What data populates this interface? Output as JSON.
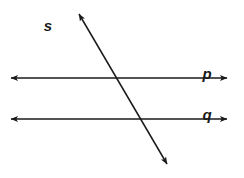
{
  "figure": {
    "kind": "geometry-diagram",
    "canvas": {
      "width": 244,
      "height": 178,
      "background": "#ffffff"
    },
    "stroke_color": "#1a1a1a",
    "stroke_width": 1.5
  },
  "labels": {
    "transversal": "s",
    "upper_parallel": "p",
    "lower_parallel": "q"
  },
  "lines": [
    {
      "id": "line-p",
      "label": "p",
      "orientation": "horizontal",
      "x1": 11,
      "y1": 78,
      "x2": 227,
      "y2": 78,
      "arrows": "both",
      "label_x": 207,
      "label_y": 72
    },
    {
      "id": "line-q",
      "label": "q",
      "orientation": "horizontal",
      "x1": 11,
      "y1": 119,
      "x2": 227,
      "y2": 119,
      "arrows": "both",
      "label_x": 207,
      "label_y": 113
    },
    {
      "id": "line-s",
      "label": "s",
      "orientation": "transversal",
      "x1": 79,
      "y1": 14,
      "x2": 167,
      "y2": 164,
      "arrows": "both",
      "label_x": 48,
      "label_y": 24
    }
  ],
  "intersections": [
    {
      "lines": "s-and-p",
      "x": 118,
      "y": 78
    },
    {
      "lines": "s-and-q",
      "x": 142,
      "y": 119
    }
  ]
}
